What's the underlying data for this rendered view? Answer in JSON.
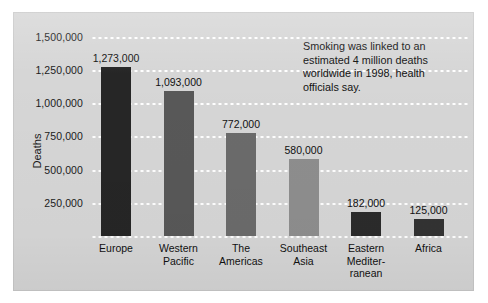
{
  "chart_data": {
    "type": "bar",
    "title": "",
    "subtitle": "",
    "xlabel": "",
    "ylabel": "Deaths",
    "ylim": [
      0,
      1500000
    ],
    "grid": true,
    "legend": "none",
    "annotation": "Smoking was linked to an estimated 4 million deaths worldwide in 1998, health officials say.",
    "ytick_labels": [
      "1,500,000",
      "1,250,000",
      "1,000,000",
      "750,000",
      "500,000",
      "250,000"
    ],
    "ytick_values": [
      1500000,
      1250000,
      1000000,
      750000,
      500000,
      250000
    ],
    "categories": [
      "Europe",
      "Western\nPacific",
      "The\nAmericas",
      "Southeast\nAsia",
      "Eastern\nMediter-\nranean",
      "Africa"
    ],
    "values": [
      1273000,
      1093000,
      772000,
      580000,
      182000,
      125000
    ],
    "value_labels": [
      "1,273,000",
      "1,093,000",
      "772,000",
      "580,000",
      "182,000",
      "125,000"
    ],
    "bar_colors": [
      "#262626",
      "#585858",
      "#6b6b6b",
      "#8e8e8e",
      "#2b2b2b",
      "#333333"
    ]
  },
  "panel": {
    "background_color": "#d6d6d6",
    "gridline_color": "#ffffff"
  }
}
